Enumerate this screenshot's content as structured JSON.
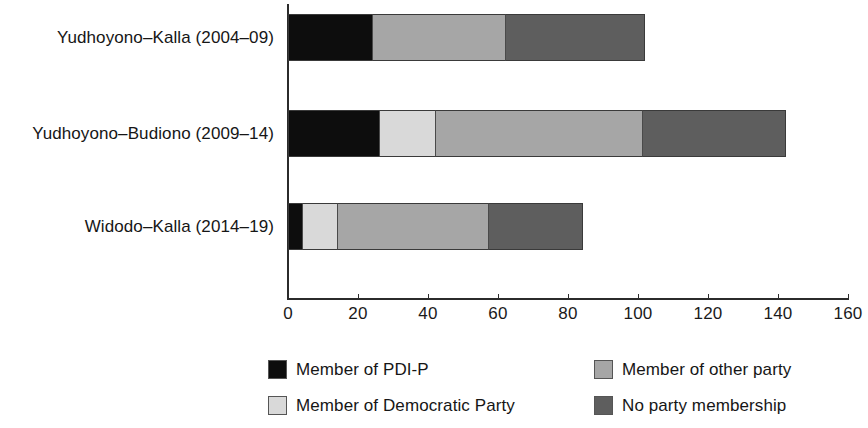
{
  "chart_data": {
    "type": "bar",
    "orientation": "horizontal",
    "stacked": true,
    "title": "",
    "subtitle": "",
    "xlabel": "",
    "ylabel": "",
    "xlim": [
      0,
      160
    ],
    "xticks": [
      0,
      20,
      40,
      60,
      80,
      100,
      120,
      140,
      160
    ],
    "xtick_labels": [
      "0",
      "20",
      "40",
      "60",
      "80",
      "100",
      "120",
      "140",
      "160"
    ],
    "grid": false,
    "legend_position": "bottom",
    "categories": [
      "Yudhoyono–Kalla (2004–09)",
      "Yudhoyono–Budiono (2009–14)",
      "Widodo–Kalla (2014–19)"
    ],
    "series": [
      {
        "name": "Member of PDI-P",
        "color": "#0d0d0d",
        "values": [
          24,
          26,
          4
        ]
      },
      {
        "name": "Member of Democratic Party",
        "color": "#d9d9d9",
        "values": [
          0,
          16,
          10
        ]
      },
      {
        "name": "Member of other party",
        "color": "#a6a6a6",
        "values": [
          38,
          59,
          43
        ]
      },
      {
        "name": "No party membership",
        "color": "#5e5e5e",
        "values": [
          40,
          41,
          27
        ]
      }
    ],
    "totals": [
      102,
      142,
      84
    ],
    "legend_entries": [
      {
        "label": "Member of PDI-P",
        "color": "#0d0d0d"
      },
      {
        "label": "Member of other party",
        "color": "#a6a6a6"
      },
      {
        "label": "Member of Democratic Party",
        "color": "#d9d9d9"
      },
      {
        "label": "No party membership",
        "color": "#5e5e5e"
      }
    ]
  },
  "axis": {
    "tick_labels": [
      "0",
      "20",
      "40",
      "60",
      "80",
      "100",
      "120",
      "140",
      "160"
    ]
  },
  "categories": {
    "c0": "Yudhoyono–Kalla (2004–09)",
    "c1": "Yudhoyono–Budiono (2009–14)",
    "c2": "Widodo–Kalla (2014–19)"
  },
  "legend": {
    "l0": "Member of PDI-P",
    "l1": "Member of other party",
    "l2": "Member of Democratic Party",
    "l3": "No party membership"
  }
}
